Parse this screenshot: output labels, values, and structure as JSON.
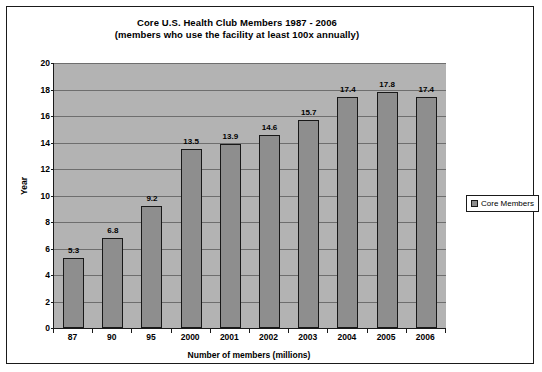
{
  "chart_data": {
    "type": "bar",
    "title": "Core U.S. Health Club Members 1987 - 2006",
    "subtitle": "(members who use the facility at least 100x annually)",
    "categories": [
      "87",
      "90",
      "95",
      "2000",
      "2001",
      "2002",
      "2003",
      "2004",
      "2005",
      "2006"
    ],
    "values": [
      5.3,
      6.8,
      9.2,
      13.5,
      13.9,
      14.6,
      15.7,
      17.4,
      17.8,
      17.4
    ],
    "series": [
      {
        "name": "Core Members",
        "values": [
          5.3,
          6.8,
          9.2,
          13.5,
          13.9,
          14.6,
          15.7,
          17.4,
          17.8,
          17.4
        ]
      }
    ],
    "xlabel": "Number of members (millions)",
    "ylabel": "Year",
    "ylim": [
      0,
      20
    ],
    "ytick_step": 2,
    "yticks": [
      0,
      2,
      4,
      6,
      8,
      10,
      12,
      14,
      16,
      18,
      20
    ],
    "grid": true,
    "grid_axis": "y",
    "legend_position": "right",
    "legend_entries": [
      "Core Members"
    ],
    "bar_color": "#8e8e8e",
    "bar_edge_color": "#181818",
    "plot_background": "#b3b3b3",
    "figure_background": "#ffffff",
    "data_labels": [
      "5.3",
      "6.8",
      "9.2",
      "13.5",
      "13.9",
      "14.6",
      "15.7",
      "17.4",
      "17.8",
      "17.4"
    ]
  }
}
